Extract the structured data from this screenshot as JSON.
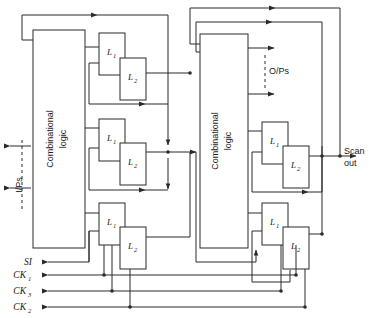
{
  "diagram": {
    "width": 369,
    "height": 318,
    "background": "#ffffff",
    "line_color": "#2a2a2a"
  },
  "blocks": [
    {
      "id": "left-combinational-logic",
      "line1": "Combinational",
      "line2": "logic",
      "x": 33,
      "y": 30,
      "w": 52,
      "h": 218
    },
    {
      "id": "right-combinational-logic",
      "line1": "Combinational",
      "line2": "logic",
      "x": 200,
      "y": 34,
      "w": 48,
      "h": 214
    }
  ],
  "latch_pairs": [
    {
      "id": "left-upper-latch-pair",
      "l1": "L",
      "l1sub": "1",
      "l2": "L",
      "l2sub": "2"
    },
    {
      "id": "left-middle-latch-pair",
      "l1": "L",
      "l1sub": "1",
      "l2": "L",
      "l2sub": "2"
    },
    {
      "id": "left-lower-latch-pair",
      "l1": "L",
      "l1sub": "1",
      "l2": "L",
      "l2sub": "2"
    },
    {
      "id": "right-middle-latch-pair",
      "l1": "L",
      "l1sub": "1",
      "l2": "L",
      "l2sub": "2"
    },
    {
      "id": "right-lower-latch-pair",
      "l1": "L",
      "l1sub": "1",
      "l2": "L",
      "l2sub": "2"
    }
  ],
  "labels": {
    "inputs": "I/Ps",
    "outputs": "O/Ps",
    "scan_out_line1": "Scan",
    "scan_out_line2": "out",
    "scan_in": "SI",
    "clock_1_base": "CK",
    "clock_1_sub": "1",
    "clock_3_base": "CK",
    "clock_3_sub": "3",
    "clock_2_base": "CK",
    "clock_2_sub": "2"
  }
}
